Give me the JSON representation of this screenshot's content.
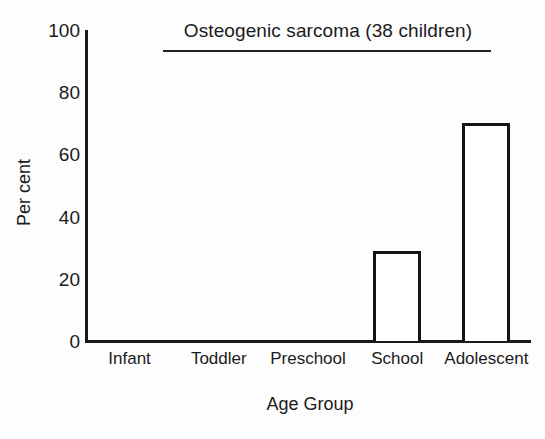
{
  "chart_data": {
    "type": "bar",
    "title": "Osteogenic sarcoma (38 children)",
    "xlabel": "Age Group",
    "ylabel": "Per cent",
    "categories": [
      "Infant",
      "Toddler",
      "Preschool",
      "School",
      "Adolescent"
    ],
    "values": [
      0,
      0,
      0,
      29,
      70
    ],
    "ylim": [
      0,
      100
    ],
    "yticks": [
      0,
      20,
      40,
      60,
      80,
      100
    ],
    "ytick_labels": [
      "0",
      "20",
      "40",
      "60",
      "80",
      "100"
    ],
    "grid": false,
    "legend": "none",
    "bar_style": "outline",
    "bar_color": "#ffffff",
    "bar_edge_color": "#141414",
    "axis_color": "#1a1a1a",
    "text_color": "#1b1b1b",
    "background_color": "#fdfdfd",
    "title_underlined": true,
    "annotations": []
  }
}
